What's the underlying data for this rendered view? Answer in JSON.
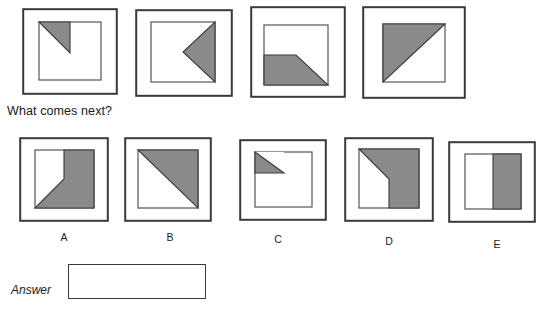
{
  "colors": {
    "shape_fill": "#8a8a8a",
    "shape_stroke": "#3a3a3a",
    "frame_stroke": "#3a3a3a",
    "inner_stroke": "#555555",
    "text": "#1a1a1a",
    "background": "#ffffff"
  },
  "prompt": {
    "text": "What comes next?"
  },
  "sequence": {
    "panels": [
      {
        "id": "sequence-panel-1",
        "shape_name": "quarter-triangle-top-left",
        "description": "Gray right triangle in the top-left quadrant of the inner square, hypotenuse from top-middle down to center-left area"
      },
      {
        "id": "sequence-panel-2",
        "shape_name": "left-pointing-arrowhead-right-half",
        "description": "Gray triangle on the right half pointing left, apex at the center of the inner square"
      },
      {
        "id": "sequence-panel-3",
        "shape_name": "trapezoid-bottom-half",
        "description": "Gray trapezoid filling the bottom half, top edge runs flat from left to center then slopes down to bottom-right corner"
      },
      {
        "id": "sequence-panel-4",
        "shape_name": "half-triangle-upper-left",
        "description": "Gray triangle filling the upper-left half of the inner square, diagonal from bottom-left to top-right"
      }
    ]
  },
  "options": {
    "items": [
      {
        "letter": "A",
        "id": "option-a",
        "shape_name": "right-half-with-diagonal-to-bottom-left",
        "description": "Gray region covering the right half plus a diagonal wedge reaching the bottom-left corner"
      },
      {
        "letter": "B",
        "id": "option-b",
        "shape_name": "half-triangle-upper-right",
        "description": "Gray triangle filling the upper-right half, diagonal from top-left to bottom-right"
      },
      {
        "letter": "C",
        "id": "option-c",
        "shape_name": "small-quarter-triangle-top-left",
        "description": "Small gray right triangle in the top-left quadrant of the inner square"
      },
      {
        "letter": "D",
        "id": "option-d",
        "shape_name": "right-half-with-diagonal-to-top-left",
        "description": "Gray region covering the right half plus a wedge reaching the top-left corner"
      },
      {
        "letter": "E",
        "id": "option-e",
        "shape_name": "solid-right-half",
        "description": "Right half of the inner square filled solid gray, split by a vertical edge"
      }
    ]
  },
  "answer": {
    "label": "Answer",
    "value": ""
  }
}
